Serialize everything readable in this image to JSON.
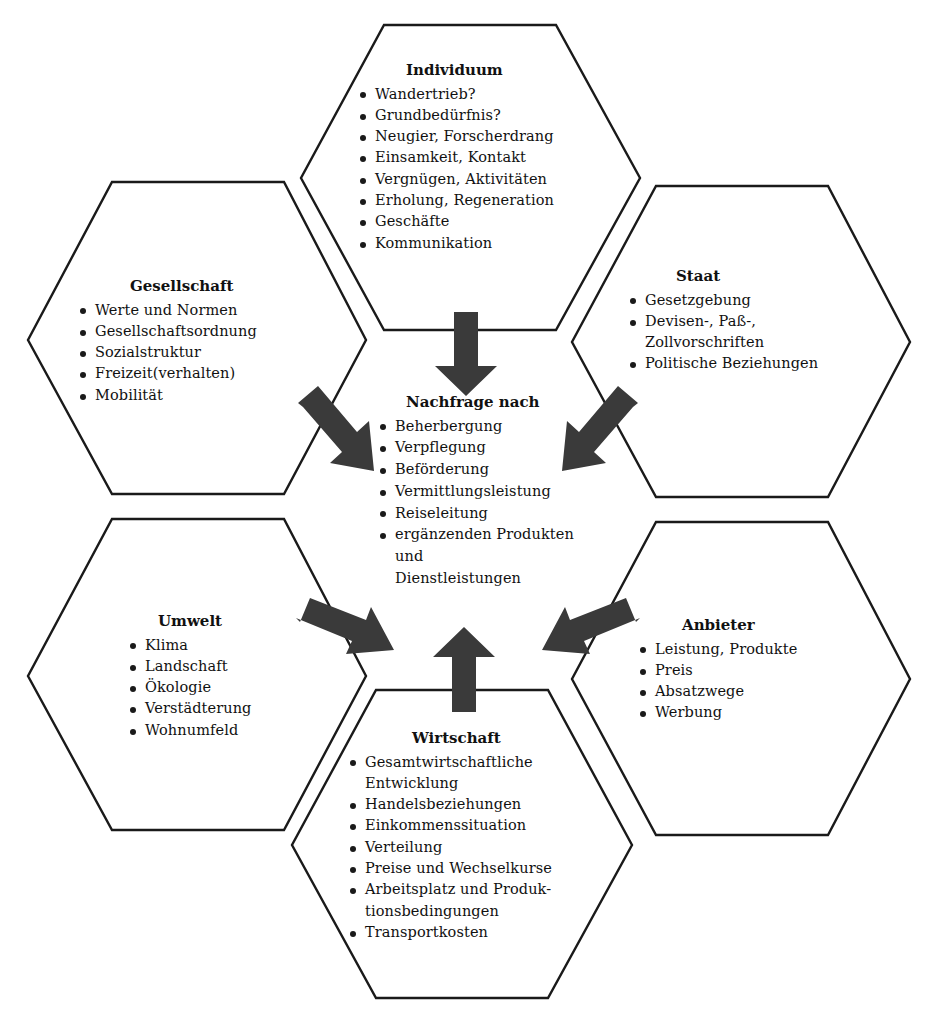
{
  "diagram": {
    "colors": {
      "outline": "#1a1a1a",
      "arrow": "#3a3a3a",
      "background": "#ffffff",
      "text": "#111111"
    },
    "center": {
      "title": "Nachfrage nach",
      "items": [
        {
          "text": "Beherbergung",
          "bullet": true
        },
        {
          "text": "Verpflegung",
          "bullet": true
        },
        {
          "text": "Beförderung",
          "bullet": true
        },
        {
          "text": "Vermittlungsleistung",
          "bullet": true
        },
        {
          "text": "Reiseleitung",
          "bullet": true
        },
        {
          "text": "ergänzenden Produkten",
          "bullet": true
        },
        {
          "text": "und",
          "bullet": false
        },
        {
          "text": "Dienstleistungen",
          "bullet": false
        }
      ]
    },
    "nodes": [
      {
        "id": "individuum",
        "title": "Individuum",
        "items": [
          {
            "text": "Wandertrieb?",
            "bullet": true
          },
          {
            "text": "Grundbedürfnis?",
            "bullet": true
          },
          {
            "text": "Neugier, Forscherdrang",
            "bullet": true
          },
          {
            "text": "Einsamkeit, Kontakt",
            "bullet": true
          },
          {
            "text": "Vergnügen, Aktivitäten",
            "bullet": true
          },
          {
            "text": "Erholung, Regeneration",
            "bullet": true
          },
          {
            "text": "Geschäfte",
            "bullet": true
          },
          {
            "text": "Kommunikation",
            "bullet": true
          }
        ]
      },
      {
        "id": "gesellschaft",
        "title": "Gesellschaft",
        "items": [
          {
            "text": "Werte und Normen",
            "bullet": true
          },
          {
            "text": "Gesellschaftsordnung",
            "bullet": true
          },
          {
            "text": "Sozialstruktur",
            "bullet": true
          },
          {
            "text": "Freizeit(verhalten)",
            "bullet": true
          },
          {
            "text": "Mobilität",
            "bullet": true
          }
        ]
      },
      {
        "id": "staat",
        "title": "Staat",
        "items": [
          {
            "text": "Gesetzgebung",
            "bullet": true
          },
          {
            "text": "Devisen-, Paß-,",
            "bullet": true
          },
          {
            "text": "Zollvorschriften",
            "bullet": false
          },
          {
            "text": "Politische Beziehungen",
            "bullet": true
          }
        ]
      },
      {
        "id": "umwelt",
        "title": "Umwelt",
        "items": [
          {
            "text": "Klima",
            "bullet": true
          },
          {
            "text": "Landschaft",
            "bullet": true
          },
          {
            "text": "Ökologie",
            "bullet": true
          },
          {
            "text": "Verstädterung",
            "bullet": true
          },
          {
            "text": "Wohnumfeld",
            "bullet": true
          }
        ]
      },
      {
        "id": "anbieter",
        "title": "Anbieter",
        "items": [
          {
            "text": "Leistung, Produkte",
            "bullet": true
          },
          {
            "text": "Preis",
            "bullet": true
          },
          {
            "text": "Absatzwege",
            "bullet": true
          },
          {
            "text": "Werbung",
            "bullet": true
          }
        ]
      },
      {
        "id": "wirtschaft",
        "title": "Wirtschaft",
        "items": [
          {
            "text": "Gesamtwirtschaftliche",
            "bullet": true
          },
          {
            "text": "Entwicklung",
            "bullet": false
          },
          {
            "text": "Handelsbeziehungen",
            "bullet": true
          },
          {
            "text": "Einkommenssituation",
            "bullet": true
          },
          {
            "text": "Verteilung",
            "bullet": true
          },
          {
            "text": "Preise und Wechselkurse",
            "bullet": true
          },
          {
            "text": "Arbeitsplatz und Produk-",
            "bullet": true
          },
          {
            "text": "tionsbedingungen",
            "bullet": false
          },
          {
            "text": "Transportkosten",
            "bullet": true
          }
        ]
      }
    ],
    "arrows": [
      {
        "id": "arrow-individuum-to-center",
        "direction": "down",
        "from": "individuum",
        "to": "center"
      },
      {
        "id": "arrow-gesellschaft-to-center",
        "direction": "down-right",
        "from": "gesellschaft",
        "to": "center"
      },
      {
        "id": "arrow-staat-to-center",
        "direction": "down-left",
        "from": "staat",
        "to": "center"
      },
      {
        "id": "arrow-umwelt-to-center",
        "direction": "up-right",
        "from": "umwelt",
        "to": "center"
      },
      {
        "id": "arrow-anbieter-to-center",
        "direction": "up-left",
        "from": "anbieter",
        "to": "center"
      },
      {
        "id": "arrow-wirtschaft-to-center",
        "direction": "up",
        "from": "wirtschaft",
        "to": "center"
      }
    ]
  }
}
